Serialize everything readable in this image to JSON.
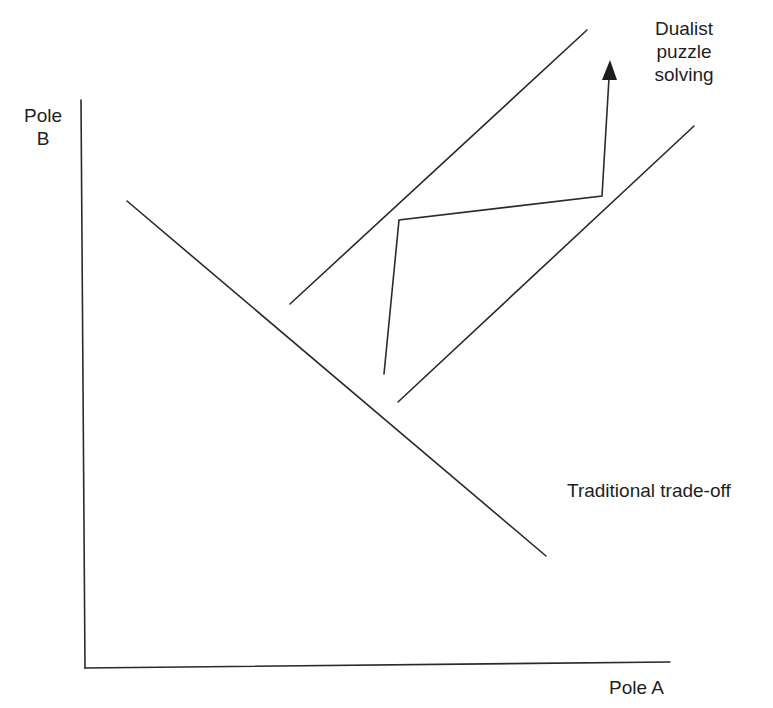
{
  "diagram": {
    "y_axis_label": [
      "Pole",
      "B"
    ],
    "x_axis_label": "Pole A",
    "traditional_label": "Traditional trade-off",
    "dualist_label": [
      "Dualist",
      "puzzle",
      "solving"
    ],
    "line_color": "#2a2a2a",
    "elements": {
      "y_axis": {
        "x1": 81,
        "y1": 100,
        "x2": 85,
        "y2": 668
      },
      "x_axis": {
        "x1": 85,
        "y1": 668,
        "x2": 670,
        "y2": 662
      },
      "trade_off_line": {
        "x1": 127,
        "y1": 201,
        "x2": 546,
        "y2": 556
      },
      "upper_boundary": {
        "x1": 290,
        "y1": 304,
        "x2": 587,
        "y2": 30
      },
      "lower_boundary": {
        "x1": 398,
        "y1": 402,
        "x2": 694,
        "y2": 126
      },
      "zigzag_path": [
        [
          384,
          374
        ],
        [
          399,
          220
        ],
        [
          602,
          196
        ],
        [
          609,
          78
        ]
      ],
      "arrow_head_tip": [
        610,
        60
      ]
    }
  }
}
